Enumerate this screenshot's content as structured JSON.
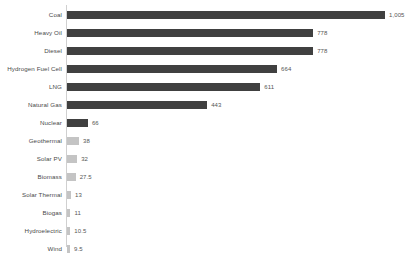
{
  "chart_data": {
    "type": "bar",
    "orientation": "horizontal",
    "title": "",
    "subtitle": "",
    "xlabel": "",
    "ylabel": "",
    "grid": false,
    "legend": "none",
    "xlim": [
      0,
      1005
    ],
    "categories": [
      "Coal",
      "Heavy Oil",
      "Diesel",
      "Hydrogen Fuel Cell",
      "LNG",
      "Natural Gas",
      "Nuclear",
      "Geothermal",
      "Solar PV",
      "Biomass",
      "Solar Thermal",
      "Biogas",
      "Hydroelectric",
      "Wind"
    ],
    "values": [
      1005,
      778,
      778,
      664,
      611,
      443,
      66,
      38,
      32,
      27.5,
      13,
      11,
      10.5,
      9.5
    ],
    "value_labels": [
      "1,005",
      "778",
      "778",
      "664",
      "611",
      "443",
      "66",
      "38",
      "32",
      "27.5",
      "13",
      "11",
      "10.5",
      "9.5"
    ],
    "bar_colors": [
      "#404040",
      "#404040",
      "#404040",
      "#404040",
      "#404040",
      "#404040",
      "#404040",
      "#c4c4c4",
      "#c4c4c4",
      "#c4c4c4",
      "#c4c4c4",
      "#c4c4c4",
      "#c4c4c4",
      "#c4c4c4"
    ],
    "colors": {
      "background": "#ffffff",
      "bar_dark": "#404040",
      "bar_light": "#c4c4c4",
      "axis": "#d0d0d0",
      "text": "#4a4a4a"
    }
  }
}
